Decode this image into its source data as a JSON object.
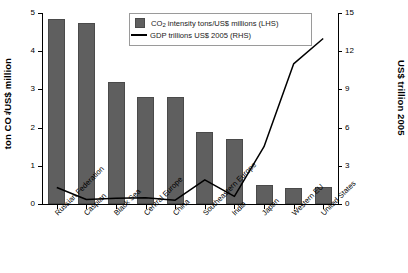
{
  "chart_data": {
    "type": "bar",
    "title": "",
    "subtitle": "",
    "xlabel": "",
    "categories": [
      "Russian Federation",
      "Caspian",
      "Black Sea",
      "Central Europe",
      "China",
      "Southeastern Europe",
      "India",
      "Japan",
      "Western EU",
      "United States"
    ],
    "series": [
      {
        "name": "CO2 intensity tons/US$ millions (LHS)",
        "type": "bar",
        "axis": "left",
        "color": "#5f5f5f",
        "values": [
          4.85,
          4.75,
          3.2,
          2.8,
          2.8,
          1.88,
          1.7,
          0.5,
          0.42,
          0.45
        ]
      },
      {
        "name": "GDP trillions US$ 2005 (RHS)",
        "type": "line",
        "axis": "right",
        "color": "#000000",
        "values": [
          1.3,
          0.35,
          0.45,
          0.5,
          0.3,
          1.9,
          0.6,
          4.5,
          11.0,
          13.0
        ]
      }
    ],
    "left_axis": {
      "label": "ton CO2/US$ million",
      "label_html": "ton CO<sub>2</sub>/US$ million",
      "min": 0,
      "max": 5,
      "tick_step": 1,
      "ticks": [
        "0",
        "1",
        "2",
        "3",
        "4",
        "5"
      ]
    },
    "right_axis": {
      "label": "US$ trillion 2005",
      "min": 0,
      "max": 15,
      "tick_step": 3,
      "ticks": [
        "0",
        "3",
        "6",
        "9",
        "12",
        "15"
      ]
    },
    "legend": {
      "position": "top-center",
      "entries": [
        {
          "marker": "square-swatch",
          "text_prefix": "CO",
          "text_sub": "2",
          "text_suffix": " intensity tons/US$ millions (LHS)"
        },
        {
          "marker": "line",
          "text": "GDP trillions US$ 2005 (RHS)"
        }
      ]
    },
    "grid": false
  }
}
